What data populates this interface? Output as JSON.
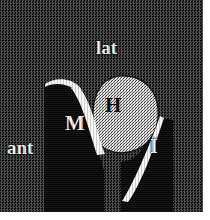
{
  "figure": {
    "kind": "anatomical-cross-section-illustration",
    "width": 210,
    "height": 220,
    "background_color": "#1b1b1b",
    "border_color": "#ffffff"
  },
  "orientation_labels": [
    {
      "id": "lat",
      "text": "lat",
      "color": "#f2f2f2",
      "meaning": "lateral"
    },
    {
      "id": "ant",
      "text": "ant",
      "color": "#f2f2f2",
      "meaning": "anterior"
    }
  ],
  "structure_labels": [
    {
      "id": "m",
      "text": "M",
      "color": "#f2f2f2",
      "region": "dark-mass-left"
    },
    {
      "id": "h",
      "text": "H",
      "color": "#0b0b0b",
      "region": "stippled-ellipse"
    },
    {
      "id": "i",
      "text": "I",
      "color": "#f2f2f2",
      "region": "dark-mass-right"
    }
  ],
  "regions": [
    {
      "id": "dark-mass-left",
      "fill": "#040404",
      "description": "left solid black column"
    },
    {
      "id": "dark-mass-right",
      "fill": "#040404",
      "description": "right solid black column"
    },
    {
      "id": "stippled-ellipse",
      "fill": "#d9d9d9",
      "description": "stippled rounded mass labelled H"
    },
    {
      "id": "crescent-medial",
      "fill": "#f6f6f6",
      "description": "bright crescent between M and H"
    },
    {
      "id": "crescent-lateral",
      "fill": "#f6f6f6",
      "description": "bright crescent between H and I"
    },
    {
      "id": "crescent-superior",
      "fill": "#f6f6f6",
      "description": "bright sliver on top of left column"
    }
  ],
  "colors": {
    "background": "#1b1b1b",
    "dark_tissue": "#040404",
    "bright_tissue": "#f6f6f6",
    "stipple_tissue": "#d9d9d9",
    "label_light": "#f2f2f2",
    "label_dark": "#0b0b0b"
  }
}
